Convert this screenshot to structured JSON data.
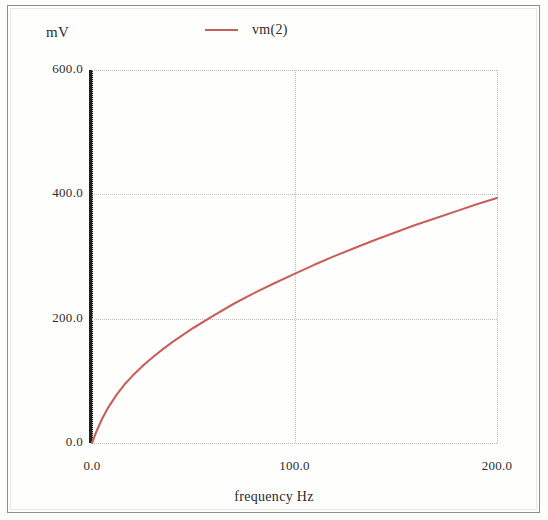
{
  "figure": {
    "y_unit_label": "mV",
    "x_axis_title": "frequency Hz",
    "legend_label": "vm(2)",
    "series_color": "#c8605a",
    "axis_color": "#23211f",
    "grid_color": "#bdbdbd"
  },
  "axes": {
    "y_ticks": [
      "600.0",
      "400.0",
      "200.0",
      "0.0"
    ],
    "x_ticks": [
      "0.0",
      "100.0",
      "200.0"
    ]
  },
  "chart_data": {
    "type": "line",
    "title": "",
    "subtitle": "",
    "xlabel": "frequency Hz",
    "ylabel": "mV",
    "xlim": [
      0,
      200
    ],
    "ylim": [
      0,
      600
    ],
    "xticks": [
      0,
      100,
      200
    ],
    "yticks": [
      0,
      200,
      400,
      600
    ],
    "xticklabels": [
      "0.0",
      "100.0",
      "200.0"
    ],
    "yticklabels": [
      "0.0",
      "200.0",
      "400.0",
      "600.0"
    ],
    "grid": true,
    "grid_style": "dotted",
    "legend": [
      "vm(2)"
    ],
    "legend_position": "top-center",
    "series": [
      {
        "name": "vm(2)",
        "color": "#c8605a",
        "x": [
          0,
          2,
          5,
          8,
          12,
          16,
          20,
          25,
          30,
          35,
          40,
          50,
          60,
          70,
          80,
          90,
          100,
          110,
          120,
          130,
          140,
          150,
          160,
          170,
          180,
          190,
          200
        ],
        "y": [
          0,
          17,
          39,
          57,
          77,
          94,
          108,
          124,
          138,
          151,
          163,
          185,
          205,
          224,
          241,
          257,
          272,
          287,
          301,
          314,
          327,
          339,
          351,
          362,
          373,
          384,
          394
        ]
      }
    ]
  }
}
